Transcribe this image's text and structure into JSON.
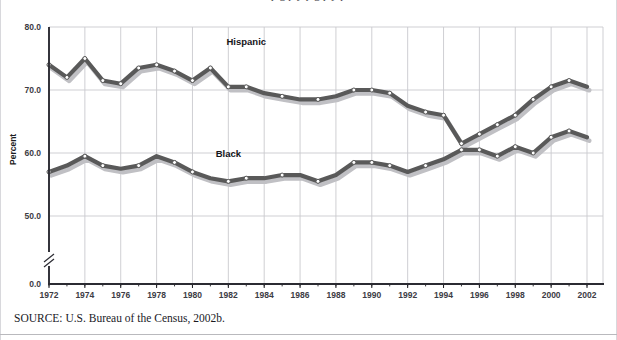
{
  "figure": {
    "top_caption": "p   g    p  y  p                                      g   p  y  p",
    "source_note": "SOURCE:  U.S. Bureau of the Census, 2002b."
  },
  "chart_data": {
    "type": "line",
    "title": "",
    "subtitle": "",
    "xlabel": "",
    "ylabel": "Percent",
    "xlim": [
      1972,
      2002
    ],
    "ylim": [
      45.5,
      80.0
    ],
    "ybreak": true,
    "y_zero_label": "0.0",
    "grid": true,
    "legend_position": "inline-labels",
    "yticks": [
      "80.0",
      "70.0",
      "60.0",
      "50.0"
    ],
    "ytick_values": [
      80.0,
      70.0,
      60.0,
      50.0
    ],
    "xticks": [
      "1972",
      "1974",
      "1976",
      "1978",
      "1980",
      "1982",
      "1984",
      "1986",
      "1988",
      "1990",
      "1992",
      "1994",
      "1996",
      "1998",
      "2000",
      "2002"
    ],
    "xtick_values": [
      1972,
      1974,
      1976,
      1978,
      1980,
      1982,
      1984,
      1986,
      1988,
      1990,
      1992,
      1994,
      1996,
      1998,
      2000,
      2002
    ],
    "x": [
      1972,
      1973,
      1974,
      1975,
      1976,
      1977,
      1978,
      1979,
      1980,
      1981,
      1982,
      1983,
      1984,
      1985,
      1986,
      1987,
      1988,
      1989,
      1990,
      1991,
      1992,
      1993,
      1994,
      1995,
      1996,
      1997,
      1998,
      1999,
      2000,
      2001,
      2002
    ],
    "series": [
      {
        "name": "Hispanic",
        "color": "#595959",
        "label_x": 1983,
        "label_y": 77.2,
        "values": [
          74.0,
          72.0,
          75.0,
          71.5,
          71.0,
          73.5,
          74.0,
          73.0,
          71.5,
          73.5,
          70.5,
          70.5,
          69.5,
          69.0,
          68.5,
          68.5,
          69.0,
          70.0,
          70.0,
          69.5,
          67.5,
          66.5,
          66.0,
          61.5,
          63.0,
          64.5,
          66.0,
          68.5,
          70.5,
          71.5,
          70.5
        ],
        "marker_years": [
          1972,
          1973,
          1974,
          1975,
          1976,
          1977,
          1978,
          1979,
          1980,
          1981,
          1982,
          1983,
          1985,
          1987,
          1989,
          1990,
          1991,
          1993,
          1994,
          1995,
          1996,
          1997,
          1998,
          1999,
          2000,
          2001
        ]
      },
      {
        "name": "Black",
        "color": "#595959",
        "label_x": 1982,
        "label_y": 59.3,
        "values": [
          57.0,
          58.0,
          59.5,
          58.0,
          57.5,
          58.0,
          59.5,
          58.5,
          57.0,
          56.0,
          55.5,
          56.0,
          56.0,
          56.5,
          56.5,
          55.5,
          56.5,
          58.5,
          58.5,
          58.0,
          57.0,
          58.0,
          59.0,
          60.5,
          60.5,
          59.5,
          61.0,
          60.0,
          62.5,
          63.5,
          62.5
        ],
        "marker_years": [
          1972,
          1974,
          1975,
          1977,
          1979,
          1980,
          1982,
          1983,
          1985,
          1987,
          1989,
          1990,
          1991,
          1993,
          1995,
          1996,
          1997,
          1998,
          1999,
          2000,
          2001
        ]
      }
    ]
  }
}
